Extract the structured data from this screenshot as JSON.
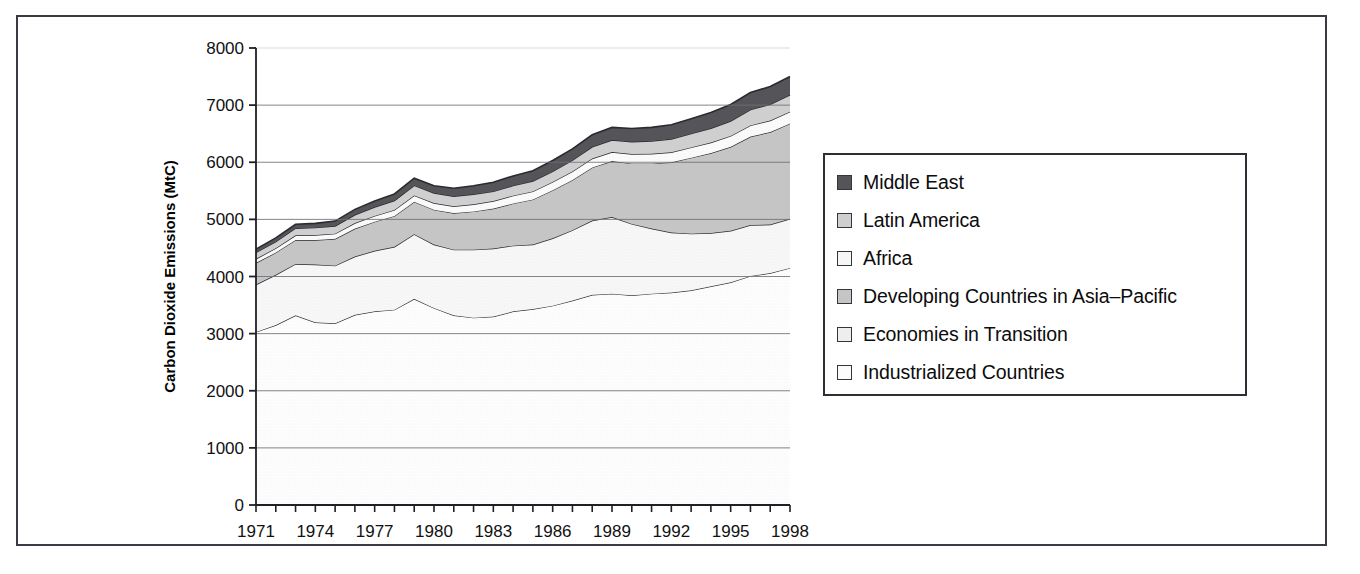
{
  "chart_data": {
    "type": "area",
    "stacked": true,
    "title": "",
    "xlabel": "",
    "ylabel": "Carbon Dioxide Emissions (MtC)",
    "xlim": [
      1971,
      1998
    ],
    "ylim": [
      0,
      8000
    ],
    "ytick_values": [
      0,
      1000,
      2000,
      3000,
      4000,
      5000,
      6000,
      7000,
      8000
    ],
    "ytick_labels": [
      "0",
      "1000",
      "2000",
      "3000",
      "4000",
      "5000",
      "6000",
      "7000",
      "8000"
    ],
    "xtick_labels": [
      "1971",
      "1974",
      "1977",
      "1980",
      "1983",
      "1986",
      "1989",
      "1992",
      "1995",
      "1998"
    ],
    "xtick_values": [
      1971,
      1974,
      1977,
      1980,
      1983,
      1986,
      1989,
      1992,
      1995,
      1998
    ],
    "x": [
      1971,
      1972,
      1973,
      1974,
      1975,
      1976,
      1977,
      1978,
      1979,
      1980,
      1981,
      1982,
      1983,
      1984,
      1985,
      1986,
      1987,
      1988,
      1989,
      1990,
      1991,
      1992,
      1993,
      1994,
      1995,
      1996,
      1997,
      1998
    ],
    "grid": true,
    "grid_axis": "y",
    "legend_position": "right-outside",
    "series": [
      {
        "name": "Industrialized Countries",
        "color": "#fbfbfb",
        "values": [
          3030,
          3150,
          3320,
          3200,
          3180,
          3330,
          3390,
          3420,
          3610,
          3450,
          3320,
          3280,
          3300,
          3390,
          3430,
          3490,
          3580,
          3680,
          3700,
          3670,
          3700,
          3720,
          3760,
          3830,
          3900,
          4010,
          4060,
          4150
        ]
      },
      {
        "name": "Economies in Transition",
        "color": "#eeeeee",
        "values": [
          830,
          880,
          900,
          1010,
          1010,
          1020,
          1060,
          1100,
          1130,
          1110,
          1150,
          1190,
          1190,
          1150,
          1130,
          1180,
          1230,
          1300,
          1340,
          1250,
          1140,
          1050,
          990,
          930,
          900,
          890,
          850,
          860
        ]
      },
      {
        "name": "Developing Countries in Asia-Pacific",
        "color": "#c5c5c5",
        "values": [
          380,
          390,
          420,
          430,
          470,
          490,
          510,
          540,
          570,
          610,
          640,
          670,
          700,
          740,
          790,
          840,
          880,
          930,
          980,
          1060,
          1140,
          1230,
          1330,
          1400,
          1470,
          1550,
          1620,
          1670
        ]
      },
      {
        "name": "Africa",
        "color": "#f6f6f6",
        "values": [
          70,
          75,
          80,
          85,
          90,
          95,
          100,
          105,
          110,
          115,
          120,
          125,
          130,
          135,
          140,
          145,
          150,
          155,
          160,
          165,
          170,
          175,
          180,
          185,
          190,
          195,
          200,
          205
        ]
      },
      {
        "name": "Latin America",
        "color": "#cfcfcf",
        "values": [
          110,
          115,
          125,
          130,
          135,
          145,
          155,
          165,
          175,
          175,
          175,
          175,
          170,
          175,
          180,
          185,
          195,
          205,
          210,
          215,
          220,
          230,
          240,
          250,
          260,
          275,
          285,
          295
        ]
      },
      {
        "name": "Middle East",
        "color": "#555559",
        "values": [
          60,
          65,
          70,
          75,
          85,
          95,
          105,
          115,
          125,
          130,
          140,
          150,
          160,
          170,
          180,
          190,
          200,
          210,
          220,
          230,
          240,
          250,
          260,
          275,
          290,
          300,
          310,
          320
        ]
      }
    ]
  },
  "legend": {
    "items": [
      {
        "label": "Middle East",
        "color": "#555559"
      },
      {
        "label": "Latin America",
        "color": "#cfcfcf"
      },
      {
        "label": "Africa",
        "color": "#f6f6f6"
      },
      {
        "label": "Developing Countries in Asia–Pacific",
        "color": "#c5c5c5"
      },
      {
        "label": "Economies in Transition",
        "color": "#eeeeee"
      },
      {
        "label": "Industrialized Countries",
        "color": "#fbfbfb"
      }
    ]
  }
}
